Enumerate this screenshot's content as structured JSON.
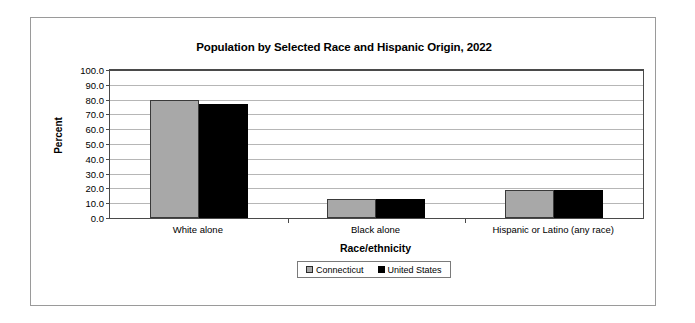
{
  "chart_data": {
    "type": "bar",
    "title": "Population by Selected Race and Hispanic Origin, 2022",
    "xlabel": "Race/ethnicity",
    "ylabel": "Percent",
    "categories": [
      "White alone",
      "Black alone",
      "Hispanic or Latino (any race)"
    ],
    "series": [
      {
        "name": "Connecticut",
        "values": [
          79.6,
          12.6,
          18.7
        ],
        "color": "#a8a8a8"
      },
      {
        "name": "United States",
        "values": [
          77.0,
          12.6,
          19.1
        ],
        "color": "#000000"
      }
    ],
    "ylim": [
      0,
      100
    ],
    "ytick_labels": [
      "100.0",
      "90.0",
      "80.0",
      "70.0",
      "60.0",
      "50.0",
      "40.0",
      "30.0",
      "20.0",
      "10.0",
      "0.0"
    ],
    "ytick_values": [
      100,
      90,
      80,
      70,
      60,
      50,
      40,
      30,
      20,
      10,
      0
    ],
    "grid": true,
    "legend_position": "bottom-center"
  },
  "legend": {
    "items": [
      {
        "label": "Connecticut",
        "swatch": "gray-square-swatch"
      },
      {
        "label": "United States",
        "swatch": "black-square-swatch"
      }
    ]
  }
}
